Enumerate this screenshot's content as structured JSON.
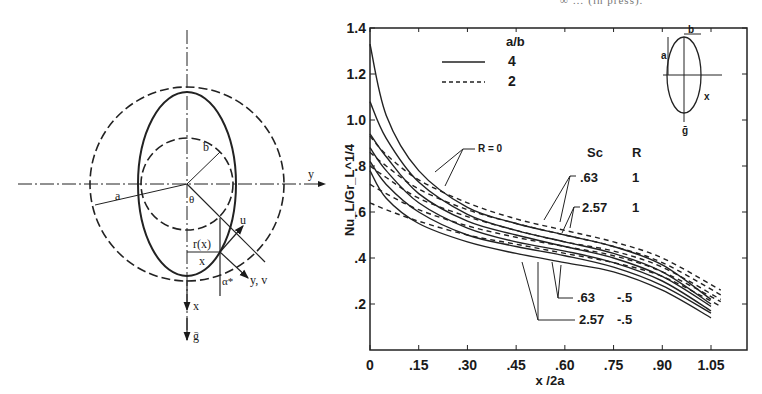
{
  "header": {
    "cropped_caption": "∞  …  (in press)."
  },
  "schematic": {
    "labels": {
      "y_axis": "y",
      "a": "a",
      "b": "b",
      "theta": "θ",
      "u": "u",
      "r_of_x": "r(x)",
      "x_local": "x",
      "alpha": "α*",
      "yv": "y, v",
      "x_axis": "x",
      "gravity": "ḡ"
    }
  },
  "inset": {
    "labels": {
      "a": "a",
      "b": "b",
      "x": "x",
      "g": "ḡ"
    }
  },
  "legend": {
    "title": "a/b",
    "entries": [
      {
        "style": "solid",
        "label": "4"
      },
      {
        "style": "dashed",
        "label": "2"
      }
    ]
  },
  "annotations": {
    "r0": "R = 0",
    "table_header": {
      "sc": "Sc",
      "r": "R"
    },
    "rows": [
      {
        "sc": ".63",
        "r": "1"
      },
      {
        "sc": "2.57",
        "r": "1"
      },
      {
        "sc": ".63",
        "r": "-.5"
      },
      {
        "sc": "2.57",
        "r": "-.5"
      }
    ]
  },
  "chart_data": {
    "type": "line",
    "title": "",
    "xlabel": "x /2a",
    "ylabel": "Nu_L/Gr_L^1/4",
    "xlim": [
      0,
      1.15
    ],
    "ylim": [
      0,
      1.4
    ],
    "xticks": [
      "0",
      ".15",
      ".30",
      ".45",
      ".60",
      ".75",
      ".90",
      "1.05"
    ],
    "yticks": [
      ".2",
      ".4",
      ".6",
      "1.0",
      "1.2",
      "1.4"
    ],
    "ytick_labels": [
      ".2",
      ".4",
      ".6",
      ".8",
      "1.0",
      "1.2",
      "1.4"
    ],
    "grid": false,
    "legend_position": "upper center",
    "x": [
      0,
      0.05,
      0.15,
      0.3,
      0.45,
      0.6,
      0.75,
      0.9,
      1.05
    ],
    "series": [
      {
        "name": "a/b=4, Sc=.63, R=1",
        "style": "solid",
        "values": [
          1.33,
          1.02,
          0.78,
          0.62,
          0.55,
          0.5,
          0.45,
          0.37,
          0.22
        ]
      },
      {
        "name": "a/b=4, Sc=2.57, R=1",
        "style": "solid",
        "values": [
          1.08,
          0.92,
          0.73,
          0.59,
          0.52,
          0.47,
          0.42,
          0.34,
          0.2
        ]
      },
      {
        "name": "a/b=4, R=0 (Sc=.63)",
        "style": "solid",
        "values": [
          0.94,
          0.84,
          0.68,
          0.56,
          0.5,
          0.45,
          0.4,
          0.32,
          0.19
        ]
      },
      {
        "name": "a/b=4, R=0 (Sc=2.57)",
        "style": "solid",
        "values": [
          0.88,
          0.78,
          0.64,
          0.53,
          0.47,
          0.43,
          0.38,
          0.3,
          0.17
        ]
      },
      {
        "name": "a/b=4, Sc=.63, R=-.5",
        "style": "solid",
        "values": [
          0.82,
          0.72,
          0.6,
          0.5,
          0.45,
          0.41,
          0.36,
          0.28,
          0.16
        ]
      },
      {
        "name": "a/b=4, Sc=2.57, R=-.5",
        "style": "solid",
        "values": [
          0.78,
          0.66,
          0.55,
          0.47,
          0.42,
          0.38,
          0.34,
          0.26,
          0.14
        ]
      },
      {
        "name": "a/b=2, Sc=.63, R=1",
        "style": "dashed",
        "values": [
          0.93,
          0.85,
          0.74,
          0.64,
          0.57,
          0.52,
          0.47,
          0.4,
          0.26
        ]
      },
      {
        "name": "a/b=2, Sc=2.57, R=1",
        "style": "dashed",
        "values": [
          0.86,
          0.8,
          0.7,
          0.61,
          0.55,
          0.5,
          0.45,
          0.38,
          0.24
        ]
      },
      {
        "name": "a/b=2, R=0",
        "style": "dashed",
        "values": [
          0.8,
          0.75,
          0.66,
          0.58,
          0.52,
          0.47,
          0.43,
          0.36,
          0.22
        ]
      },
      {
        "name": "a/b=2, Sc=.63, R=-.5",
        "style": "dashed",
        "values": [
          0.72,
          0.68,
          0.61,
          0.54,
          0.49,
          0.45,
          0.41,
          0.34,
          0.21
        ]
      },
      {
        "name": "a/b=2, Sc=2.57, R=-.5",
        "style": "dashed",
        "values": [
          0.64,
          0.61,
          0.56,
          0.5,
          0.46,
          0.42,
          0.38,
          0.32,
          0.19
        ]
      }
    ]
  }
}
